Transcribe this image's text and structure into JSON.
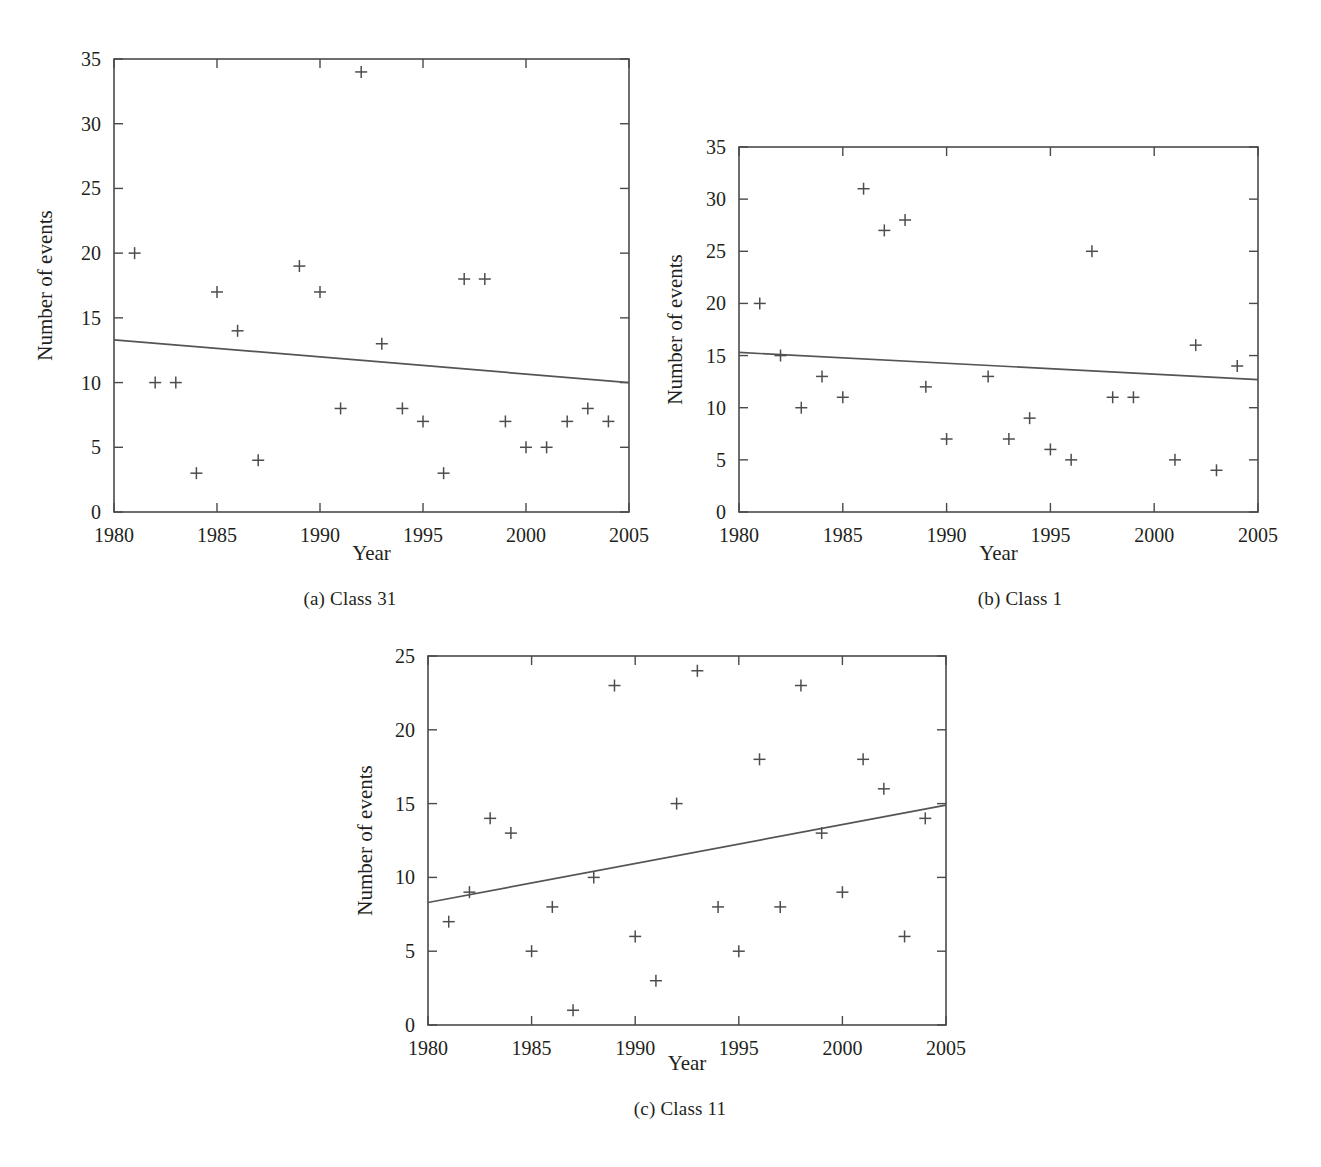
{
  "figure": {
    "background_color": "#ffffff",
    "axis_color": "#4a4a4a",
    "marker_color": "#4d4d4f",
    "trend_color": "#555456",
    "text_color": "#231f20"
  },
  "panels": [
    {
      "id": "panel-a",
      "caption": "(a)  Class 31",
      "caption_index": "(a)",
      "caption_text": "Class 31"
    },
    {
      "id": "panel-b",
      "caption": "(b)  Class 1",
      "caption_index": "(b)",
      "caption_text": "Class 1"
    },
    {
      "id": "panel-c",
      "caption": "(c)  Class 11",
      "caption_index": "(c)",
      "caption_text": "Class 11"
    }
  ],
  "chart_data": [
    {
      "panel": "a",
      "type": "scatter",
      "title": "(a)  Class 31",
      "xlabel": "Year",
      "ylabel": "Number of events",
      "xlim": [
        1980,
        2005
      ],
      "ylim": [
        0,
        35
      ],
      "xticks": [
        1980,
        1985,
        1990,
        1995,
        2000,
        2005
      ],
      "xticklabels": [
        "1980",
        "1985",
        "1990",
        "1995",
        "2000",
        "2005"
      ],
      "yticks": [
        0,
        5,
        10,
        15,
        20,
        25,
        30,
        35
      ],
      "yticklabels": [
        "0",
        "5",
        "10",
        "15",
        "20",
        "25",
        "30",
        "35"
      ],
      "grid": false,
      "legend": null,
      "marker": "+",
      "x": [
        1981,
        1982,
        1983,
        1984,
        1985,
        1986,
        1987,
        1989,
        1990,
        1991,
        1992,
        1993,
        1994,
        1995,
        1996,
        1997,
        1998,
        1999,
        2000,
        2001,
        2002,
        2003,
        2004
      ],
      "y": [
        20,
        10,
        10,
        3,
        17,
        14,
        4,
        19,
        17,
        8,
        34,
        13,
        8,
        7,
        3,
        18,
        18,
        7,
        5,
        5,
        7,
        8,
        7
      ],
      "trendline": {
        "type": "linear",
        "x": [
          1980,
          2005
        ],
        "y": [
          13.3,
          10.0
        ],
        "slope": -0.132,
        "intercept": 13.3,
        "direction": "decreasing"
      }
    },
    {
      "panel": "b",
      "type": "scatter",
      "title": "(b)  Class 1",
      "xlabel": "Year",
      "ylabel": "Number of events",
      "xlim": [
        1980,
        2005
      ],
      "ylim": [
        0,
        35
      ],
      "xticks": [
        1980,
        1985,
        1990,
        1995,
        2000,
        2005
      ],
      "xticklabels": [
        "1980",
        "1985",
        "1990",
        "1995",
        "2000",
        "2005"
      ],
      "yticks": [
        0,
        5,
        10,
        15,
        20,
        25,
        30,
        35
      ],
      "yticklabels": [
        "0",
        "5",
        "10",
        "15",
        "20",
        "25",
        "30",
        "35"
      ],
      "grid": false,
      "legend": null,
      "marker": "+",
      "x": [
        1981,
        1982,
        1983,
        1984,
        1985,
        1986,
        1987,
        1988,
        1989,
        1990,
        1992,
        1993,
        1994,
        1995,
        1996,
        1997,
        1998,
        1999,
        2001,
        2002,
        2003,
        2004
      ],
      "y": [
        20,
        15,
        10,
        13,
        11,
        31,
        27,
        28,
        12,
        7,
        13,
        7,
        9,
        6,
        5,
        25,
        11,
        11,
        5,
        16,
        4,
        14
      ],
      "trendline": {
        "type": "linear",
        "x": [
          1980,
          2005
        ],
        "y": [
          15.3,
          12.7
        ],
        "slope": -0.104,
        "intercept": 15.3,
        "direction": "decreasing"
      }
    },
    {
      "panel": "c",
      "type": "scatter",
      "title": "(c)  Class 11",
      "xlabel": "Year",
      "ylabel": "Number of events",
      "xlim": [
        1980,
        2005
      ],
      "ylim": [
        0,
        25
      ],
      "xticks": [
        1980,
        1985,
        1990,
        1995,
        2000,
        2005
      ],
      "xticklabels": [
        "1980",
        "1985",
        "1990",
        "1995",
        "2000",
        "2005"
      ],
      "yticks": [
        0,
        5,
        10,
        15,
        20,
        25
      ],
      "yticklabels": [
        "0",
        "5",
        "10",
        "15",
        "20",
        "25"
      ],
      "grid": false,
      "legend": null,
      "marker": "+",
      "x": [
        1981,
        1982,
        1983,
        1984,
        1985,
        1986,
        1987,
        1988,
        1989,
        1990,
        1991,
        1992,
        1993,
        1994,
        1995,
        1996,
        1997,
        1998,
        1999,
        2000,
        2001,
        2002,
        2003,
        2004
      ],
      "y": [
        7,
        9,
        14,
        13,
        5,
        8,
        1,
        10,
        23,
        6,
        3,
        15,
        24,
        8,
        5,
        18,
        8,
        23,
        13,
        9,
        18,
        16,
        6,
        14
      ],
      "trendline": {
        "type": "linear",
        "x": [
          1980,
          2005
        ],
        "y": [
          8.3,
          14.9
        ],
        "slope": 0.264,
        "intercept": 8.3,
        "direction": "increasing"
      }
    }
  ]
}
